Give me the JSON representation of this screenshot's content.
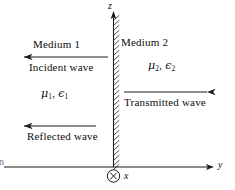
{
  "figure": {
    "background_color": "#ffffff",
    "line_color": "#1a1a1a"
  },
  "axes": {
    "vertical": {
      "name": "z-axis",
      "label": "z",
      "arrow": "up"
    },
    "horizontal": {
      "name": "y-axis",
      "label": "y",
      "arrow": "right"
    },
    "out_of_page": {
      "name": "x-axis",
      "label": "x",
      "marker": "circle-x-icon"
    }
  },
  "boundary": {
    "name": "interface-hatched-line",
    "style": "hatched vertical line"
  },
  "regions": [
    {
      "id": "medium-1",
      "title": "Medium 1",
      "params_mu": "μ",
      "params_mu_sub": "1",
      "params_eps": "ϵ",
      "params_eps_sub": "1",
      "params_sep": ", "
    },
    {
      "id": "medium-2",
      "title": "Medium 2",
      "params_mu": "μ",
      "params_mu_sub": "2",
      "params_eps": "ϵ",
      "params_eps_sub": "2",
      "params_sep": ", "
    }
  ],
  "waves": [
    {
      "id": "incident-wave",
      "label": "Incident wave",
      "direction": "left"
    },
    {
      "id": "reflected-wave",
      "label": "Reflected wave",
      "direction": "left"
    },
    {
      "id": "transmitted-wave",
      "label": "Transmitted wave",
      "direction": "right"
    }
  ],
  "edge_fragment": {
    "text": "n"
  }
}
